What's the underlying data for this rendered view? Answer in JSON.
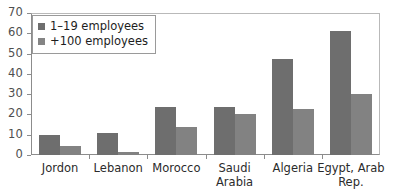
{
  "chart_data": {
    "type": "bar",
    "title": "",
    "xlabel": "",
    "ylabel": "",
    "ylim": [
      0,
      70
    ],
    "yticks": [
      0,
      10,
      20,
      30,
      40,
      50,
      60,
      70
    ],
    "grid": false,
    "legend_position": "top-left",
    "categories": [
      "Jordon",
      "Lebanon",
      "Morocco",
      "Saudi Arabia",
      "Algeria",
      "Egypt, Arab Rep."
    ],
    "category_lines": [
      [
        "Jordon"
      ],
      [
        "Lebanon"
      ],
      [
        "Morocco"
      ],
      [
        "Saudi",
        "Arabia"
      ],
      [
        "Algeria"
      ],
      [
        "Egypt, Arab",
        "Rep."
      ]
    ],
    "series": [
      {
        "name": "1–19 employees",
        "color": "#6e6e6e",
        "values": [
          10,
          11,
          23.5,
          23.5,
          47.5,
          61
        ]
      },
      {
        "name": "+100 employees",
        "color": "#828282",
        "values": [
          4.5,
          1.5,
          14,
          20,
          22.5,
          30
        ]
      }
    ]
  },
  "legend": {
    "items": [
      {
        "label": "1–19 employees",
        "swatch": "legend-swatch-dark"
      },
      {
        "label": "+100 employees",
        "swatch": "legend-swatch-light"
      }
    ]
  },
  "axis": {
    "y_tick_labels": [
      "70",
      "60",
      "50",
      "40",
      "30",
      "20",
      "10",
      "0"
    ]
  }
}
